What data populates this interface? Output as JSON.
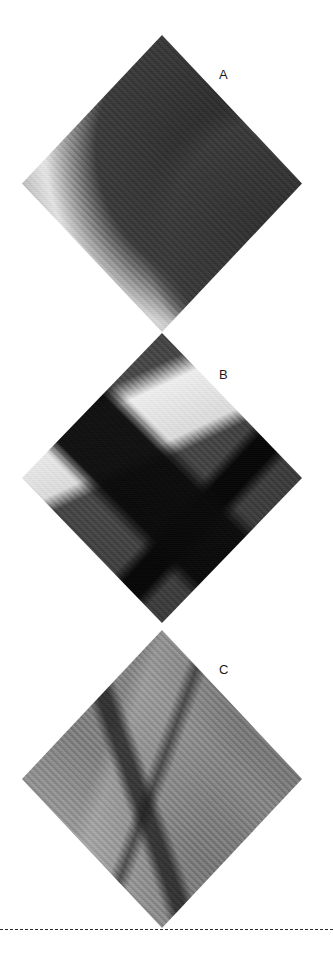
{
  "figure": {
    "type": "image-panel-figure",
    "orientation": "vertical-stack",
    "panel_shape": "diamond",
    "colorspace": "grayscale",
    "background_color": "#ffffff",
    "label_color": "#1a1a1a",
    "rule_color": "#2b2b2b",
    "panels": [
      {
        "label": "A",
        "description": "Diamond-cropped grayscale photo fragment: bright white rounded forms against darker vertically-striped background, with a small dark round object at right of centre.",
        "tone": "light-mid grey with white highlights"
      },
      {
        "label": "B",
        "description": "Diamond-cropped grayscale photo fragment: large dark dome-like mass with a bright white wedge at upper right, a black horizontal rim band, and a black vertical post below.",
        "tone": "dark grey to black"
      },
      {
        "label": "C",
        "description": "Diamond-cropped grayscale photo fragment: flat mid-grey surface with angular crease/step edges forming a stair-like corner.",
        "tone": "uniform mid grey"
      }
    ],
    "rule": {
      "style": "dashed",
      "position": "bottom"
    }
  }
}
